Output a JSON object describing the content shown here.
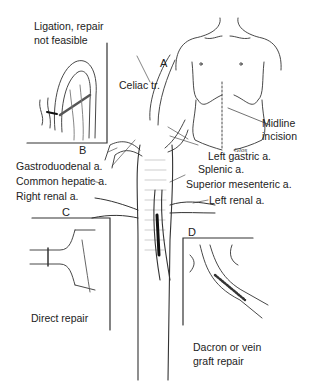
{
  "figure": {
    "panels": {
      "A": {
        "letter": "A",
        "caption_line1": "Midline",
        "caption_line2": "incision"
      },
      "B": {
        "letter": "B",
        "caption_line1": "Ligation, repair",
        "caption_line2": "not feasible"
      },
      "C": {
        "letter": "C",
        "caption": "Direct repair"
      },
      "D": {
        "letter": "D",
        "caption_line1": "Dacron or vein",
        "caption_line2": "graft repair"
      }
    },
    "vessel_labels": {
      "celiac": "Celiac tr.",
      "left_gastric": "Left gastric a.",
      "splenic": "Splenic a.",
      "gastroduodenal": "Gastroduodenal a.",
      "common_hepatic": "Common hepatic a.",
      "superior_mesenteric": "Superior mesenteric a.",
      "right_renal": "Right renal a.",
      "left_renal": "Left renal a."
    },
    "signature": "Glos"
  }
}
